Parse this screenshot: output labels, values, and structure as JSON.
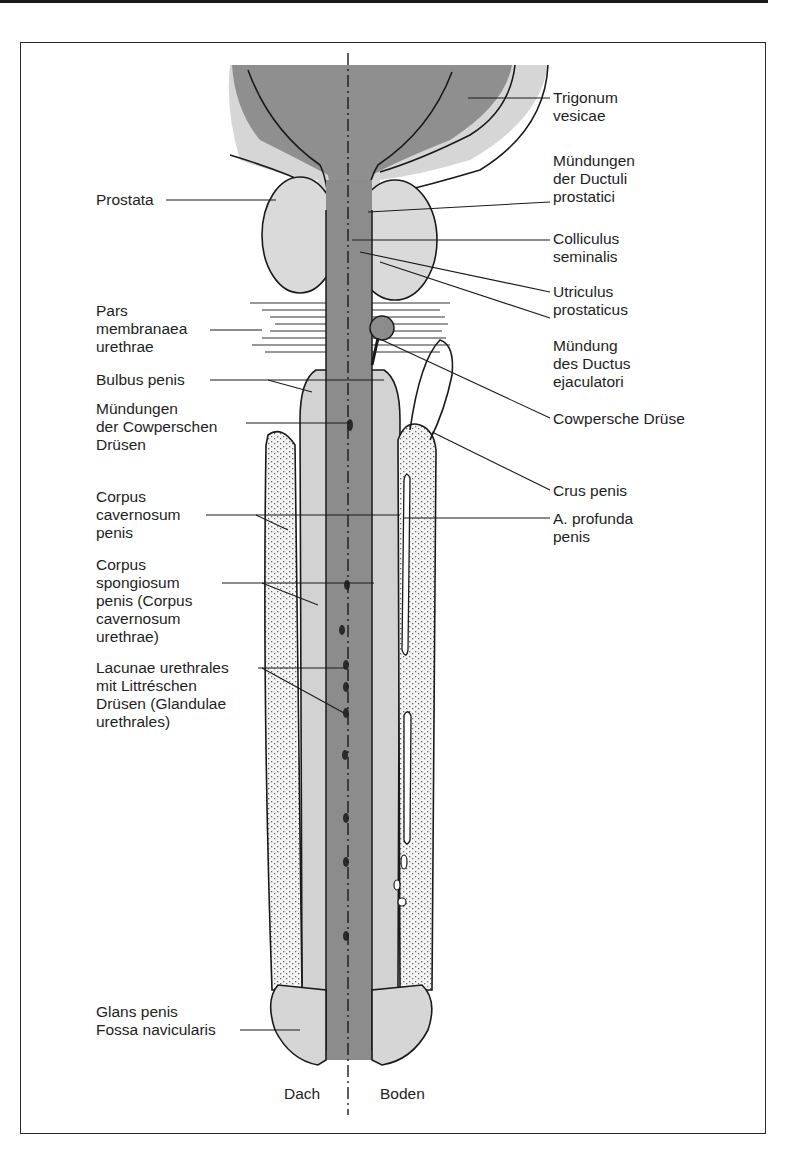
{
  "figure": {
    "axis_labels": {
      "left": "Dach",
      "right": "Boden"
    },
    "labels_right": [
      {
        "id": "trigonum",
        "text": "Trigonum\nvesicae"
      },
      {
        "id": "muendungen-ductuli",
        "text": "Mündungen\nder Ductuli\nprostatici"
      },
      {
        "id": "colliculus",
        "text": "Colliculus\nseminalis"
      },
      {
        "id": "utriculus",
        "text": "Utriculus\nprostaticus"
      },
      {
        "id": "muendung-ductus",
        "text": "Mündung\ndes Ductus\nejaculatori"
      },
      {
        "id": "cowpersche-druese",
        "text": "Cowpersche Drüse"
      },
      {
        "id": "crus-penis",
        "text": "Crus penis"
      },
      {
        "id": "a-profunda",
        "text": "A. profunda\npenis"
      }
    ],
    "labels_left": [
      {
        "id": "prostata",
        "text": "Prostata"
      },
      {
        "id": "pars-membranacea",
        "text": "Pars\nmembranaea\nurethrae"
      },
      {
        "id": "bulbus-penis",
        "text": "Bulbus penis"
      },
      {
        "id": "muendungen-cowper",
        "text": "Mündungen\nder Cowperschen\nDrüsen"
      },
      {
        "id": "corpus-cavernosum",
        "text": "Corpus\ncavernosum\npenis"
      },
      {
        "id": "corpus-spongiosum",
        "text": "Corpus\nspongiosum\npenis (Corpus\ncavernosum\nurethrae)"
      },
      {
        "id": "lacunae",
        "text": "Lacunae urethrales\nmit Littréschen\nDrüsen (Glandulae\nurethrales)"
      },
      {
        "id": "glans",
        "text": "Glans penis\nFossa navicularis"
      }
    ],
    "colors": {
      "dark_fill": "#8f8f8f",
      "light_fill": "#d4d4d4",
      "stipple_fill": "#f2f2f2",
      "outline": "#1a1a1a"
    }
  }
}
